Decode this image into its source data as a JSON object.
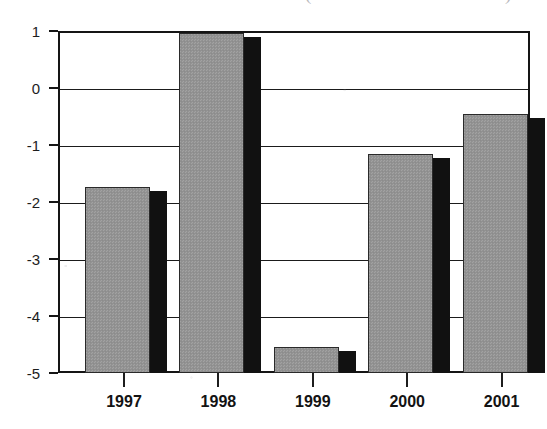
{
  "title_remnant": {
    "left_fragment": "(",
    "right_fragment": ")",
    "note_label": "clipped-title-fragments"
  },
  "chart_data": {
    "type": "bar",
    "title": "",
    "xlabel": "",
    "ylabel": "",
    "categories": [
      "1997",
      "1998",
      "1999",
      "2000",
      "2001"
    ],
    "values": [
      -1.7,
      1.6,
      -4.5,
      -1.12,
      -0.42
    ],
    "value_labels": [
      "-1.7",
      "1.6",
      "-4.5",
      "-1.12",
      "-0.42"
    ],
    "ylim": [
      -5,
      1
    ],
    "yticks": [
      1,
      0,
      -1,
      -2,
      -3,
      -4,
      -5
    ],
    "ytick_labels": [
      "1",
      "0",
      "-1",
      "-2",
      "-3",
      "-4",
      "-5"
    ],
    "xtick_labels": [
      "1997",
      "1998",
      "1999",
      "2000",
      "2001"
    ],
    "grid": true,
    "legend": "none",
    "baseline": -5,
    "clipped_bars": [
      "1998"
    ],
    "bar_style": "gray-dither-with-black-drop-shadow",
    "colors": {
      "bar_fill": "#949494",
      "bar_shadow": "#111111",
      "bar_outline": "#2a2a2a",
      "axis": "#151515",
      "gridline": "#1b1b1b",
      "text": "#131313",
      "background": "#ffffff"
    }
  }
}
